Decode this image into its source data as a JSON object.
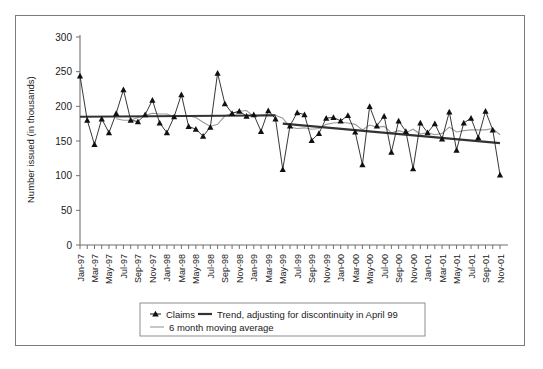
{
  "chart_data": {
    "type": "line",
    "title": "",
    "xlabel": "",
    "ylabel": "Number issued (in thousands)",
    "ylim": [
      0,
      300
    ],
    "yticks": [
      0,
      50,
      100,
      150,
      200,
      250,
      300
    ],
    "grid": false,
    "legend_position": "bottom",
    "x_tick_labels": [
      "Jan-97",
      "Mar-97",
      "May-97",
      "Jul-97",
      "Sep-97",
      "Nov-97",
      "Jan-98",
      "Mar-98",
      "May-98",
      "Jul-98",
      "Sep-98",
      "Nov-98",
      "Jan-99",
      "Mar-99",
      "May-99",
      "Jul-99",
      "Sep-99",
      "Nov-99",
      "Jan-00",
      "Mar-00",
      "May-00",
      "Jul-00",
      "Sep-00",
      "Nov-00",
      "Jan-01",
      "Mar-01",
      "May-01",
      "Jul-01",
      "Sep-01",
      "Nov-01"
    ],
    "x": [
      "Jan-97",
      "Feb-97",
      "Mar-97",
      "Apr-97",
      "May-97",
      "Jun-97",
      "Jul-97",
      "Aug-97",
      "Sep-97",
      "Oct-97",
      "Nov-97",
      "Dec-97",
      "Jan-98",
      "Feb-98",
      "Mar-98",
      "Apr-98",
      "May-98",
      "Jun-98",
      "Jul-98",
      "Aug-98",
      "Sep-98",
      "Oct-98",
      "Nov-98",
      "Dec-98",
      "Jan-99",
      "Feb-99",
      "Mar-99",
      "Apr-99",
      "May-99",
      "Jun-99",
      "Jul-99",
      "Aug-99",
      "Sep-99",
      "Oct-99",
      "Nov-99",
      "Dec-99",
      "Jan-00",
      "Feb-00",
      "Mar-00",
      "Apr-00",
      "May-00",
      "Jun-00",
      "Jul-00",
      "Aug-00",
      "Sep-00",
      "Oct-00",
      "Nov-00",
      "Dec-00",
      "Jan-01",
      "Feb-01",
      "Mar-01",
      "Apr-01",
      "May-01",
      "Jun-01",
      "Jul-01",
      "Aug-01",
      "Sep-01",
      "Oct-01",
      "Nov-01"
    ],
    "series": [
      {
        "name": "Claims",
        "style": "line-markers",
        "marker": "triangle",
        "color": "#101010",
        "values": [
          244,
          180,
          145,
          182,
          162,
          190,
          224,
          180,
          178,
          188,
          209,
          176,
          162,
          185,
          217,
          171,
          167,
          157,
          170,
          248,
          204,
          190,
          193,
          186,
          188,
          164,
          194,
          182,
          109,
          172,
          191,
          188,
          151,
          161,
          183,
          184,
          179,
          187,
          163,
          116,
          200,
          172,
          186,
          134,
          179,
          164,
          110,
          176,
          162,
          175,
          153,
          192,
          137,
          176,
          183,
          155,
          193,
          166,
          101
        ]
      },
      {
        "name": "Trend, adjusting for discontinuity in April 99",
        "style": "line",
        "color": "#333333",
        "segments": [
          {
            "from": "Jan-97",
            "to": "Apr-99",
            "start_value": 185,
            "end_value": 187
          },
          {
            "from": "May-99",
            "to": "Nov-01",
            "start_value": 175,
            "end_value": 147
          }
        ]
      },
      {
        "name": "6 month moving average",
        "style": "line",
        "color": "#9a9a9a",
        "values": [
          null,
          null,
          null,
          null,
          null,
          182,
          180,
          180,
          184,
          187,
          190,
          189,
          189,
          185,
          186,
          186,
          184,
          177,
          171,
          174,
          186,
          190,
          193,
          194,
          185,
          187,
          188,
          187,
          183,
          170,
          168,
          169,
          167,
          168,
          174,
          176,
          177,
          176,
          174,
          166,
          173,
          170,
          171,
          162,
          165,
          162,
          167,
          160,
          162,
          159,
          161,
          170,
          163,
          165,
          166,
          166,
          166,
          168,
          159
        ]
      }
    ]
  },
  "legend": {
    "items": [
      {
        "label": "Claims",
        "marker": "triangle",
        "color": "#101010"
      },
      {
        "label": "Trend, adjusting for discontinuity in April 99",
        "marker": "thick-line",
        "color": "#333333"
      },
      {
        "label": "6 month moving average",
        "marker": "thin-line",
        "color": "#9a9a9a"
      }
    ]
  }
}
